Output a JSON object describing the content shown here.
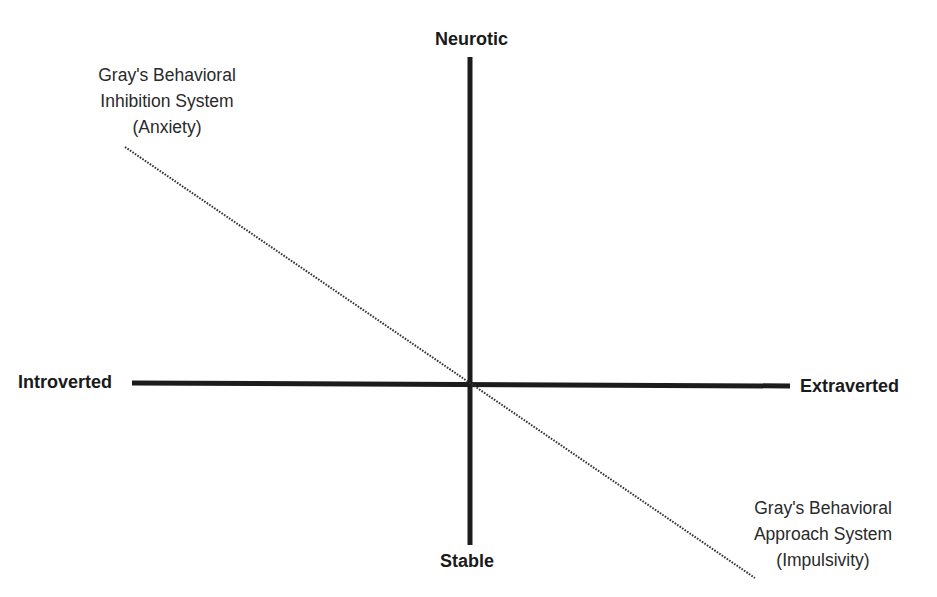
{
  "diagram": {
    "type": "two-axis personality dimension diagram",
    "axes": {
      "vertical": {
        "top_label": "Neurotic",
        "bottom_label": "Stable"
      },
      "horizontal": {
        "left_label": "Introverted",
        "right_label": "Extraverted"
      }
    },
    "diagonal": {
      "style": "dotted",
      "upper_left_label": {
        "lines": [
          "Gray's Behavioral",
          "Inhibition System",
          "(Anxiety)"
        ]
      },
      "lower_right_label": {
        "lines": [
          "Gray's Behavioral",
          "Approach System",
          "(Impulsivity)"
        ]
      }
    },
    "colors": {
      "axis": "#1c1c1c",
      "diagonal": "#333333",
      "background": "#ffffff"
    }
  }
}
